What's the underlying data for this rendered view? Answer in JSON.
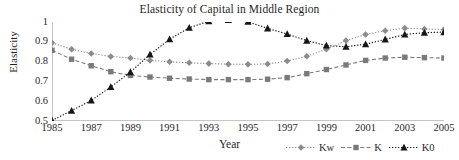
{
  "chart_data": {
    "type": "line",
    "title": "Elasticity of Capital in Middle Region",
    "xlabel": "Year",
    "ylabel": "Elasticity",
    "x": [
      1985,
      1986,
      1987,
      1988,
      1989,
      1990,
      1991,
      1992,
      1993,
      1994,
      1995,
      1996,
      1997,
      1998,
      1999,
      2000,
      2001,
      2002,
      2003,
      2004,
      2005
    ],
    "xlim": [
      1985,
      2005
    ],
    "ylim": [
      0.5,
      1.0
    ],
    "yticks": [
      "0.5",
      "0.6",
      "0.7",
      "0.8",
      "0.9",
      "1"
    ],
    "ytick_values": [
      0.5,
      0.6,
      0.7,
      0.8,
      0.9,
      1.0
    ],
    "xticks": [
      "1985",
      "1987",
      "1989",
      "1991",
      "1993",
      "1995",
      "1997",
      "1999",
      "2001",
      "2003",
      "2005"
    ],
    "xtick_values": [
      1985,
      1987,
      1989,
      1991,
      1993,
      1995,
      1997,
      1999,
      2001,
      2003,
      2005
    ],
    "grid": false,
    "legend_position": "bottom-right",
    "series": [
      {
        "name": "Kw",
        "marker": "diamond",
        "line_style": "dotted",
        "color": "#8c8c8c",
        "values": [
          0.895,
          0.862,
          0.841,
          0.826,
          0.818,
          0.806,
          0.799,
          0.794,
          0.79,
          0.787,
          0.786,
          0.788,
          0.803,
          0.827,
          0.862,
          0.906,
          0.937,
          0.956,
          0.969,
          0.965,
          0.962
        ]
      },
      {
        "name": "K",
        "marker": "square",
        "line_style": "dashed",
        "color": "#7a7a7a",
        "values": [
          0.857,
          0.812,
          0.779,
          0.749,
          0.73,
          0.722,
          0.716,
          0.712,
          0.709,
          0.709,
          0.709,
          0.711,
          0.719,
          0.739,
          0.76,
          0.783,
          0.806,
          0.818,
          0.822,
          0.82,
          0.818
        ]
      },
      {
        "name": "K0",
        "marker": "triangle",
        "line_style": "dotted",
        "color": "#161616",
        "values": [
          0.503,
          0.552,
          0.604,
          0.672,
          0.747,
          0.836,
          0.913,
          0.971,
          1.004,
          1.01,
          1.001,
          0.968,
          0.939,
          0.906,
          0.881,
          0.875,
          0.888,
          0.912,
          0.937,
          0.946,
          0.949
        ]
      }
    ]
  },
  "legend": {
    "items": [
      {
        "label": "Kw"
      },
      {
        "label": "K"
      },
      {
        "label": "K0"
      }
    ]
  }
}
